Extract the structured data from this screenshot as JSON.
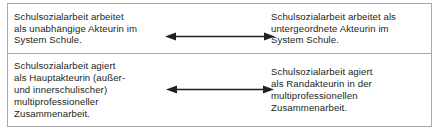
{
  "table": {
    "rows": [
      {
        "left_text": "Schulsozialarbeit arbeitet\nals unabhängige Akteurin im\nSystem Schule.",
        "right_text": "Schulsozialarbeit arbeitet als\nuntergeordnete Akteurin im\nSystem Schule.",
        "connector": "double-headed-arrow"
      },
      {
        "left_text": "Schulsozialarbeit agiert\nals Hauptakteurin (außer-\nund innerschulischer)\nmultiprofessioneller\nZusammenarbeit.",
        "right_text": "Schulsozialarbeit agiert\nals Randakteurin in der\nmultiprofessionellen\nZusammenarbeit.",
        "connector": "double-headed-arrow"
      }
    ]
  },
  "style": {
    "border_color": "#a9a9ab",
    "text_color": "#231f20",
    "arrow_color": "#231f20",
    "background": "#ffffff"
  }
}
